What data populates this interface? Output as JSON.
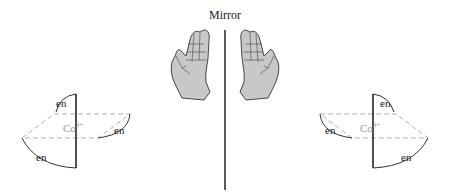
{
  "title": "Mirror",
  "left_complex": {
    "metal": "Co",
    "charge": "3+",
    "ligands": [
      "en",
      "en",
      "en"
    ]
  },
  "right_complex": {
    "metal": "Co",
    "charge": "3+",
    "ligands": [
      "en",
      "en",
      "en"
    ]
  },
  "colors": {
    "line": "#222222",
    "dashed": "#b0b0b0",
    "hand_fill": "#c8c8c8",
    "metal_label": "#9a9a9a"
  }
}
